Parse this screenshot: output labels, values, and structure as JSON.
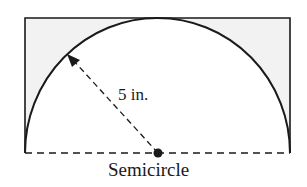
{
  "figure": {
    "shape": "semicircle inscribed in rectangle",
    "radius_label": "5 in.",
    "caption": "Semicircle",
    "radius_value": 5,
    "radius_unit": "in."
  },
  "colors": {
    "stroke": "#1a1a1a",
    "shaded_region": "#f2f2f2",
    "background": "#ffffff"
  }
}
